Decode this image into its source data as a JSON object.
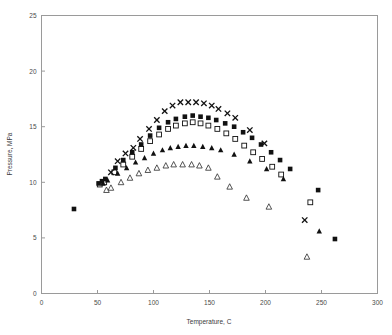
{
  "chart_data": {
    "type": "scatter",
    "title": "",
    "xlabel": "Temperature, C",
    "ylabel": "Pressure, MPa",
    "xlim": [
      0,
      300
    ],
    "ylim": [
      0,
      25
    ],
    "xticks": [
      0,
      50,
      100,
      150,
      200,
      250,
      300
    ],
    "yticks": [
      0,
      5,
      10,
      15,
      20,
      25
    ],
    "grid": false,
    "legend": "none",
    "series": [
      {
        "name": "cross-series",
        "marker": "cross",
        "color": "#111111",
        "points": [
          [
            62,
            10.9
          ],
          [
            68,
            11.9
          ],
          [
            75,
            12.6
          ],
          [
            82,
            13.1
          ],
          [
            88,
            13.9
          ],
          [
            96,
            14.8
          ],
          [
            103,
            15.6
          ],
          [
            110,
            16.4
          ],
          [
            117,
            16.9
          ],
          [
            124,
            17.2
          ],
          [
            131,
            17.2
          ],
          [
            138,
            17.2
          ],
          [
            145,
            17.1
          ],
          [
            152,
            16.9
          ],
          [
            158,
            16.6
          ],
          [
            166,
            16.2
          ],
          [
            173,
            15.8
          ],
          [
            186,
            14.7
          ],
          [
            199,
            13.5
          ],
          [
            235,
            6.6
          ]
        ]
      },
      {
        "name": "filled-square-series",
        "marker": "filled-square",
        "color": "#111111",
        "points": [
          [
            29,
            7.6
          ],
          [
            51,
            9.9
          ],
          [
            54,
            10.1
          ],
          [
            57,
            10.3
          ],
          [
            66,
            11.3
          ],
          [
            73,
            12.0
          ],
          [
            81,
            12.7
          ],
          [
            89,
            13.4
          ],
          [
            97,
            14.2
          ],
          [
            105,
            14.9
          ],
          [
            113,
            15.4
          ],
          [
            120,
            15.7
          ],
          [
            128,
            15.9
          ],
          [
            135,
            16.0
          ],
          [
            142,
            15.9
          ],
          [
            149,
            15.8
          ],
          [
            156,
            15.6
          ],
          [
            164,
            15.3
          ],
          [
            172,
            15.0
          ],
          [
            180,
            14.5
          ],
          [
            188,
            14.0
          ],
          [
            196,
            13.4
          ],
          [
            205,
            12.7
          ],
          [
            213,
            12.0
          ],
          [
            222,
            11.2
          ],
          [
            247,
            9.3
          ],
          [
            262,
            4.9
          ]
        ]
      },
      {
        "name": "open-square-series",
        "marker": "open-square",
        "color": "#111111",
        "points": [
          [
            52,
            9.8
          ],
          [
            56,
            10.0
          ],
          [
            65,
            10.9
          ],
          [
            73,
            11.6
          ],
          [
            81,
            12.3
          ],
          [
            89,
            13.0
          ],
          [
            97,
            13.7
          ],
          [
            105,
            14.3
          ],
          [
            113,
            14.8
          ],
          [
            120,
            15.1
          ],
          [
            128,
            15.3
          ],
          [
            135,
            15.4
          ],
          [
            142,
            15.3
          ],
          [
            149,
            15.1
          ],
          [
            157,
            14.8
          ],
          [
            165,
            14.4
          ],
          [
            173,
            13.9
          ],
          [
            181,
            13.3
          ],
          [
            189,
            12.7
          ],
          [
            197,
            12.1
          ],
          [
            206,
            11.4
          ],
          [
            214,
            10.7
          ],
          [
            240,
            8.2
          ]
        ]
      },
      {
        "name": "filled-triangle-series",
        "marker": "filled-triangle",
        "color": "#111111",
        "points": [
          [
            55,
            9.9
          ],
          [
            59,
            10.2
          ],
          [
            68,
            10.8
          ],
          [
            76,
            11.3
          ],
          [
            84,
            11.8
          ],
          [
            92,
            12.2
          ],
          [
            100,
            12.6
          ],
          [
            108,
            12.9
          ],
          [
            115,
            13.1
          ],
          [
            122,
            13.2
          ],
          [
            129,
            13.3
          ],
          [
            136,
            13.3
          ],
          [
            144,
            13.2
          ],
          [
            152,
            13.1
          ],
          [
            160,
            12.9
          ],
          [
            172,
            12.5
          ],
          [
            186,
            11.9
          ],
          [
            201,
            11.2
          ],
          [
            216,
            10.3
          ],
          [
            248,
            5.6
          ]
        ]
      },
      {
        "name": "open-triangle-series",
        "marker": "open-triangle",
        "color": "#2a2a2a",
        "points": [
          [
            58,
            9.3
          ],
          [
            62,
            9.5
          ],
          [
            71,
            10.0
          ],
          [
            79,
            10.4
          ],
          [
            87,
            10.8
          ],
          [
            95,
            11.1
          ],
          [
            103,
            11.3
          ],
          [
            111,
            11.5
          ],
          [
            118,
            11.6
          ],
          [
            126,
            11.6
          ],
          [
            134,
            11.6
          ],
          [
            141,
            11.5
          ],
          [
            149,
            11.3
          ],
          [
            157,
            10.5
          ],
          [
            168,
            9.6
          ],
          [
            183,
            8.6
          ],
          [
            203,
            7.8
          ],
          [
            237,
            3.3
          ]
        ]
      }
    ]
  }
}
